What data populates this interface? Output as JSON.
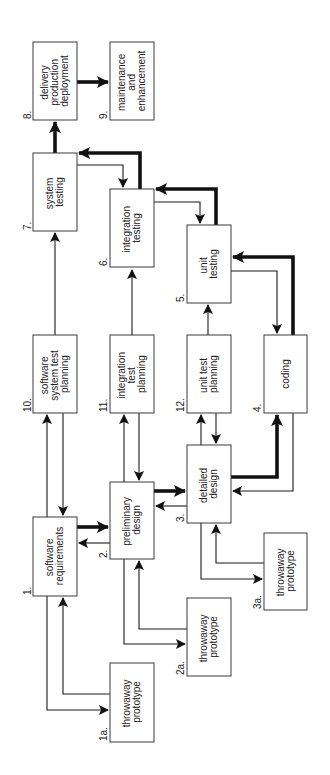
{
  "diagram": {
    "orientation": "rotated-90-ccw",
    "colors": {
      "background": "#ffffff",
      "stroke": "#1a1a1a",
      "text": "#222222"
    },
    "nodes": [
      {
        "id": "1",
        "number": "1.",
        "lines": [
          "software",
          "requirements"
        ]
      },
      {
        "id": "1a",
        "number": "1a.",
        "lines": [
          "throwaway",
          "prototype"
        ]
      },
      {
        "id": "2",
        "number": "2.",
        "lines": [
          "preliminary",
          "design"
        ]
      },
      {
        "id": "2a",
        "number": "2a.",
        "lines": [
          "throwaway",
          "prototype"
        ]
      },
      {
        "id": "3",
        "number": "3.",
        "lines": [
          "detailed",
          "design"
        ]
      },
      {
        "id": "3a",
        "number": "3a.",
        "lines": [
          "throwaway",
          "prototype"
        ]
      },
      {
        "id": "4",
        "number": "4.",
        "lines": [
          "coding"
        ]
      },
      {
        "id": "5",
        "number": "5.",
        "lines": [
          "unit",
          "testing"
        ]
      },
      {
        "id": "6",
        "number": "6.",
        "lines": [
          "integration",
          "testing"
        ]
      },
      {
        "id": "7",
        "number": "7.",
        "lines": [
          "system",
          "testing"
        ]
      },
      {
        "id": "8",
        "number": "8.",
        "lines": [
          "delivery",
          "production",
          "deployment"
        ]
      },
      {
        "id": "9",
        "number": "9.",
        "lines": [
          "maintenance",
          "and",
          "enhancement"
        ]
      },
      {
        "id": "10",
        "number": "10.",
        "lines": [
          "software",
          "system test",
          "planning"
        ]
      },
      {
        "id": "11",
        "number": "11.",
        "lines": [
          "integration",
          "test",
          "planning"
        ]
      },
      {
        "id": "12",
        "number": "12.",
        "lines": [
          "unit test",
          "planning"
        ]
      }
    ],
    "edges": [
      {
        "from": "1",
        "to": "2",
        "weight": "thick"
      },
      {
        "from": "2",
        "to": "1",
        "weight": "thin"
      },
      {
        "from": "2",
        "to": "3",
        "weight": "thick"
      },
      {
        "from": "3",
        "to": "2",
        "weight": "thin"
      },
      {
        "from": "3",
        "to": "4",
        "weight": "thick"
      },
      {
        "from": "4",
        "to": "3",
        "weight": "thin"
      },
      {
        "from": "4",
        "to": "5",
        "weight": "thick"
      },
      {
        "from": "5",
        "to": "4",
        "weight": "thin"
      },
      {
        "from": "5",
        "to": "6",
        "weight": "thick"
      },
      {
        "from": "6",
        "to": "5",
        "weight": "thin"
      },
      {
        "from": "6",
        "to": "7",
        "weight": "thick"
      },
      {
        "from": "7",
        "to": "6",
        "weight": "thin"
      },
      {
        "from": "7",
        "to": "8",
        "weight": "thick"
      },
      {
        "from": "8",
        "to": "9",
        "weight": "thick"
      },
      {
        "from": "1",
        "to": "1a",
        "weight": "thin"
      },
      {
        "from": "1a",
        "to": "1",
        "weight": "thin"
      },
      {
        "from": "2",
        "to": "2a",
        "weight": "thin"
      },
      {
        "from": "2a",
        "to": "2",
        "weight": "thin"
      },
      {
        "from": "3",
        "to": "3a",
        "weight": "thin"
      },
      {
        "from": "3a",
        "to": "3",
        "weight": "thin"
      },
      {
        "from": "1",
        "to": "10",
        "weight": "thin"
      },
      {
        "from": "10",
        "to": "1",
        "weight": "thin"
      },
      {
        "from": "2",
        "to": "11",
        "weight": "thin"
      },
      {
        "from": "11",
        "to": "2",
        "weight": "thin"
      },
      {
        "from": "3",
        "to": "12",
        "weight": "thin"
      },
      {
        "from": "12",
        "to": "3",
        "weight": "thin"
      },
      {
        "from": "10",
        "to": "7",
        "weight": "thin"
      },
      {
        "from": "11",
        "to": "6",
        "weight": "thin"
      },
      {
        "from": "12",
        "to": "5",
        "weight": "thin"
      }
    ]
  }
}
